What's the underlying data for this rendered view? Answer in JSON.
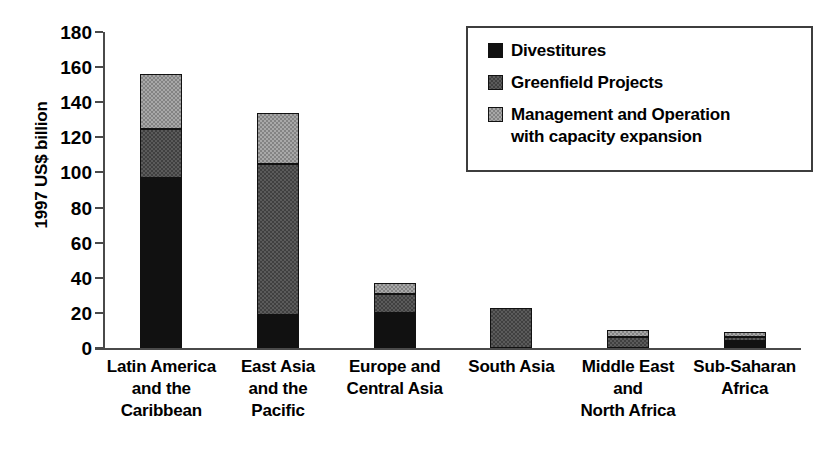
{
  "chart_data": {
    "type": "bar",
    "subtype": "stacked-bar",
    "title": "",
    "xlabel": "",
    "ylabel": "1997 US$ billion",
    "ylim": [
      0,
      180
    ],
    "ytick_interval": 20,
    "yticks": [
      0,
      20,
      40,
      60,
      80,
      100,
      120,
      140,
      160,
      180
    ],
    "ytick_labels": [
      "0",
      "20",
      "40",
      "60",
      "80",
      "100",
      "120",
      "140",
      "160",
      "180"
    ],
    "grid": false,
    "legend_position": "top-right",
    "categories": [
      "Latin America\nand the\nCaribbean",
      "East Asia\nand the\nPacific",
      "Europe and\nCentral Asia",
      "South Asia",
      "Middle East\nand\nNorth Africa",
      "Sub-Saharan\nAfrica"
    ],
    "series": [
      {
        "name": "Divestitures",
        "color": "#111111",
        "values": [
          97,
          19,
          20,
          0,
          0,
          4
        ]
      },
      {
        "name": "Greenfield Projects",
        "color": "#5b5b5b",
        "values": [
          28,
          86,
          11,
          23,
          6,
          2
        ]
      },
      {
        "name": "Management and Operation\nwith capacity expansion",
        "color": "#a8a8a8",
        "values": [
          31,
          29,
          6,
          0,
          4,
          3
        ]
      }
    ],
    "totals": [
      156,
      134,
      37,
      23,
      10,
      9
    ]
  },
  "legend": {
    "entries": [
      {
        "label": "Divestitures",
        "swatch": "black-swatch"
      },
      {
        "label": "Greenfield Projects",
        "swatch": "dark-gray-swatch"
      },
      {
        "label": "Management and Operation\nwith capacity expansion",
        "swatch": "light-gray-swatch"
      }
    ]
  }
}
